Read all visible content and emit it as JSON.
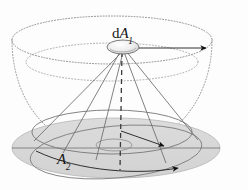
{
  "figure": {
    "background_color": "#fdfdfd",
    "line_color": "#4a4a4a",
    "dark_line_color": "#1a1a1a",
    "dotted_color": "#8a8a8a",
    "disk_fill_color": "#d9d9d9",
    "disk_edge_color": "#6e6e6e",
    "patch_fill_color": "#e2e2e2",
    "labels": {
      "source_area": {
        "prefix": "d",
        "symbol": "A",
        "subscript": "1",
        "text": "dA1"
      },
      "target_area": {
        "prefix": "",
        "symbol": "A",
        "subscript": "2",
        "text": "A2"
      }
    },
    "elements": {
      "hemisphere_rim": "dotted-ellipse-top",
      "hemisphere_bowl": "dotted-arc-bowl",
      "inner_latitude_ring": "dotted-ellipse-inner",
      "base_disk": "filled-ellipse-A2",
      "cone_base_ring": "solid-ellipse-cone-base",
      "center_small_ellipse": "solid-ellipse-small",
      "axis": "dashed-vertical-axis",
      "radius_arrow": "arrow-to-rim",
      "ray_arrow_upper": "arrow-ray-upper",
      "ray_arrow_lower": "arrow-ray-lower",
      "source_patch": "shaded-disk-dA1"
    }
  }
}
